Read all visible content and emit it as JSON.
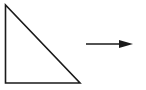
{
  "diagram": {
    "shapes": [
      {
        "type": "right-triangle",
        "points": [
          [
            5,
            5
          ],
          [
            5,
            83
          ],
          [
            80,
            83
          ]
        ],
        "stroke": "#1a1a1a",
        "fill": "#ffffff"
      },
      {
        "type": "arrow",
        "direction": "right",
        "from": [
          86,
          44
        ],
        "to": [
          133,
          44
        ],
        "stroke": "#1a1a1a"
      }
    ],
    "background": "#ffffff"
  }
}
